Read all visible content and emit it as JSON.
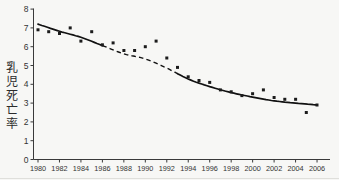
{
  "chart_data": {
    "type": "scatter",
    "title": "",
    "xlabel": "",
    "ylabel": "乳児死亡率",
    "x": [
      1980,
      1981,
      1982,
      1983,
      1984,
      1985,
      1986,
      1987,
      1988,
      1989,
      1990,
      1991,
      1992,
      1993,
      1994,
      1995,
      1996,
      1997,
      1998,
      1999,
      2000,
      2001,
      2002,
      2003,
      2004,
      2005,
      2006
    ],
    "values": [
      6.9,
      6.8,
      6.7,
      7.0,
      6.3,
      6.8,
      6.1,
      6.2,
      5.8,
      5.8,
      6.0,
      6.3,
      5.4,
      4.9,
      4.4,
      4.2,
      4.1,
      3.7,
      3.6,
      3.4,
      3.5,
      3.7,
      3.3,
      3.2,
      3.2,
      2.5,
      2.9
    ],
    "trend": {
      "x": [
        1980,
        1982,
        1984,
        1986,
        1988,
        1990,
        1992,
        1994,
        1996,
        1998,
        2000,
        2002,
        2004,
        2006
      ],
      "values": [
        7.2,
        6.82,
        6.5,
        6.06,
        5.62,
        5.35,
        4.86,
        4.28,
        3.88,
        3.56,
        3.32,
        3.12,
        3.0,
        2.9
      ],
      "solid_until": 1986,
      "dashed_until": 1993
    },
    "xlim": [
      1980,
      2006
    ],
    "ylim": [
      0,
      8
    ],
    "x_ticks": [
      1980,
      1982,
      1984,
      1986,
      1988,
      1990,
      1992,
      1994,
      1996,
      1998,
      2000,
      2002,
      2004,
      2006
    ],
    "y_ticks": [
      0,
      1,
      2,
      3,
      4,
      5,
      6,
      7,
      8
    ],
    "grid": false,
    "legend": "none",
    "marker": "square",
    "colors": {
      "points": "#1c1c1c",
      "line": "#111111",
      "axis": "#3a3a3a",
      "text": "#333333",
      "background": "#f7f7f5"
    }
  }
}
